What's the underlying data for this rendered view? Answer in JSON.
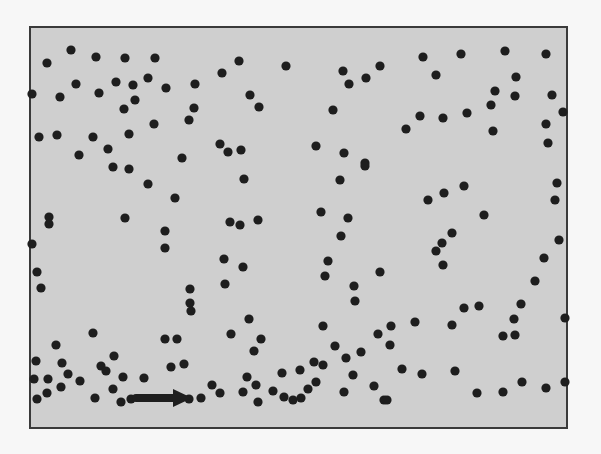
{
  "figure": {
    "background": "#f7f7f7",
    "panel": {
      "x": 30,
      "y": 27,
      "width": 537,
      "height": 401,
      "fill": "#cfcfcf",
      "stroke": "#3a3a3a",
      "stroke_width": 2
    },
    "dot_color": "#1e1e1e",
    "dot_radius": 4.6,
    "dots": [
      [
        71,
        50
      ],
      [
        47,
        63
      ],
      [
        96,
        57
      ],
      [
        125,
        58
      ],
      [
        155,
        58
      ],
      [
        76,
        84
      ],
      [
        116,
        82
      ],
      [
        133,
        85
      ],
      [
        148,
        78
      ],
      [
        166,
        88
      ],
      [
        195,
        84
      ],
      [
        32,
        94
      ],
      [
        60,
        97
      ],
      [
        99,
        93
      ],
      [
        135,
        100
      ],
      [
        124,
        109
      ],
      [
        194,
        108
      ],
      [
        189,
        120
      ],
      [
        154,
        124
      ],
      [
        39,
        137
      ],
      [
        57,
        135
      ],
      [
        93,
        137
      ],
      [
        129,
        134
      ],
      [
        108,
        149
      ],
      [
        79,
        155
      ],
      [
        182,
        158
      ],
      [
        239,
        61
      ],
      [
        222,
        73
      ],
      [
        286,
        66
      ],
      [
        343,
        71
      ],
      [
        349,
        84
      ],
      [
        366,
        78
      ],
      [
        380,
        66
      ],
      [
        250,
        95
      ],
      [
        259,
        107
      ],
      [
        333,
        110
      ],
      [
        220,
        144
      ],
      [
        228,
        152
      ],
      [
        241,
        150
      ],
      [
        316,
        146
      ],
      [
        344,
        153
      ],
      [
        365,
        163
      ],
      [
        423,
        57
      ],
      [
        461,
        54
      ],
      [
        505,
        51
      ],
      [
        546,
        54
      ],
      [
        436,
        75
      ],
      [
        516,
        77
      ],
      [
        495,
        91
      ],
      [
        515,
        96
      ],
      [
        552,
        95
      ],
      [
        491,
        105
      ],
      [
        420,
        116
      ],
      [
        443,
        118
      ],
      [
        467,
        113
      ],
      [
        563,
        112
      ],
      [
        406,
        129
      ],
      [
        493,
        131
      ],
      [
        546,
        124
      ],
      [
        548,
        143
      ],
      [
        113,
        167
      ],
      [
        129,
        169
      ],
      [
        148,
        184
      ],
      [
        175,
        198
      ],
      [
        49,
        217
      ],
      [
        49,
        224
      ],
      [
        125,
        218
      ],
      [
        165,
        231
      ],
      [
        165,
        248
      ],
      [
        32,
        244
      ],
      [
        37,
        272
      ],
      [
        41,
        288
      ],
      [
        190,
        289
      ],
      [
        244,
        179
      ],
      [
        340,
        180
      ],
      [
        365,
        166
      ],
      [
        230,
        222
      ],
      [
        240,
        225
      ],
      [
        258,
        220
      ],
      [
        321,
        212
      ],
      [
        348,
        218
      ],
      [
        341,
        236
      ],
      [
        224,
        259
      ],
      [
        243,
        267
      ],
      [
        328,
        261
      ],
      [
        380,
        272
      ],
      [
        225,
        284
      ],
      [
        325,
        276
      ],
      [
        354,
        286
      ],
      [
        428,
        200
      ],
      [
        444,
        193
      ],
      [
        464,
        186
      ],
      [
        484,
        215
      ],
      [
        557,
        183
      ],
      [
        555,
        200
      ],
      [
        559,
        240
      ],
      [
        452,
        233
      ],
      [
        442,
        243
      ],
      [
        436,
        251
      ],
      [
        443,
        265
      ],
      [
        544,
        258
      ],
      [
        535,
        281
      ],
      [
        190,
        303
      ],
      [
        191,
        311
      ],
      [
        93,
        333
      ],
      [
        165,
        339
      ],
      [
        177,
        339
      ],
      [
        56,
        345
      ],
      [
        36,
        361
      ],
      [
        62,
        363
      ],
      [
        114,
        356
      ],
      [
        101,
        366
      ],
      [
        106,
        371
      ],
      [
        171,
        367
      ],
      [
        184,
        364
      ],
      [
        34,
        379
      ],
      [
        48,
        379
      ],
      [
        68,
        374
      ],
      [
        80,
        381
      ],
      [
        123,
        377
      ],
      [
        144,
        378
      ],
      [
        61,
        387
      ],
      [
        113,
        389
      ],
      [
        47,
        393
      ],
      [
        37,
        399
      ],
      [
        95,
        398
      ],
      [
        121,
        402
      ],
      [
        131,
        399
      ],
      [
        189,
        399
      ],
      [
        201,
        398
      ],
      [
        355,
        301
      ],
      [
        249,
        319
      ],
      [
        323,
        326
      ],
      [
        231,
        334
      ],
      [
        261,
        339
      ],
      [
        378,
        334
      ],
      [
        254,
        351
      ],
      [
        335,
        346
      ],
      [
        361,
        352
      ],
      [
        346,
        358
      ],
      [
        314,
        362
      ],
      [
        323,
        365
      ],
      [
        282,
        373
      ],
      [
        300,
        370
      ],
      [
        353,
        375
      ],
      [
        247,
        377
      ],
      [
        212,
        385
      ],
      [
        256,
        385
      ],
      [
        316,
        382
      ],
      [
        374,
        386
      ],
      [
        220,
        393
      ],
      [
        243,
        392
      ],
      [
        273,
        391
      ],
      [
        308,
        389
      ],
      [
        344,
        392
      ],
      [
        284,
        397
      ],
      [
        293,
        400
      ],
      [
        301,
        398
      ],
      [
        258,
        402
      ],
      [
        384,
        400
      ],
      [
        464,
        308
      ],
      [
        479,
        306
      ],
      [
        521,
        304
      ],
      [
        514,
        319
      ],
      [
        565,
        318
      ],
      [
        391,
        326
      ],
      [
        415,
        322
      ],
      [
        452,
        325
      ],
      [
        503,
        336
      ],
      [
        515,
        335
      ],
      [
        390,
        345
      ],
      [
        402,
        369
      ],
      [
        422,
        374
      ],
      [
        455,
        371
      ],
      [
        522,
        382
      ],
      [
        546,
        388
      ],
      [
        565,
        382
      ],
      [
        477,
        393
      ],
      [
        503,
        392
      ],
      [
        387,
        400
      ]
    ],
    "arrow": {
      "x1": 136,
      "y1": 398,
      "x2": 190,
      "y2": 398,
      "head_x": 176,
      "stroke_width": 8,
      "color": "#1e1e1e",
      "direction": "right"
    }
  }
}
